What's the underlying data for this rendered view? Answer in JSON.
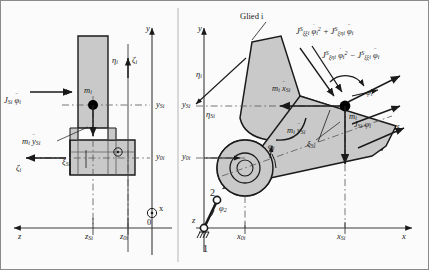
{
  "figure": {
    "title_label": "Glied i"
  },
  "colors": {
    "body_fill": "#c9c9c9",
    "body_stroke": "#1a1a1a",
    "axis": "#3a3a3a",
    "dash": "#555555",
    "background": "#fbfbfb",
    "mass_point": "#000000"
  },
  "left_view": {
    "name": "front-view",
    "axes": [
      {
        "name": "y-axis",
        "label": "y"
      },
      {
        "name": "z-axis",
        "label": "z"
      },
      {
        "name": "x-axis-out-of-page",
        "label": "x"
      },
      {
        "name": "origin",
        "label": "0"
      }
    ],
    "coordinate_labels": [
      {
        "name": "y-si",
        "base": "y",
        "sub": "Si"
      },
      {
        "name": "y-0i",
        "base": "y",
        "sub": "0i"
      },
      {
        "name": "z-si",
        "base": "z",
        "sub": "Si"
      },
      {
        "name": "z-0i",
        "base": "z",
        "sub": "0i"
      }
    ],
    "body_axes": [
      {
        "name": "eta-i",
        "base": "η",
        "sub": "i"
      },
      {
        "name": "xi-i-top",
        "base": "ζ",
        "sub": "i"
      },
      {
        "name": "zeta-i-left",
        "base": "ζ",
        "sub": "i"
      },
      {
        "name": "xi-si",
        "base": "ξ",
        "sub": "Si"
      }
    ],
    "mass_label": {
      "base": "m",
      "sub": "i"
    },
    "forces": [
      {
        "name": "moment-jsi-phi",
        "base": "J",
        "sub": "Si",
        "sym": "φ",
        "sym_sub": "i",
        "dots": 2,
        "text": "J_Si φ̈_i"
      },
      {
        "name": "force-mi-ysi",
        "base": "m",
        "sub": "i",
        "sym": "y",
        "sym_sub": "Si",
        "dots": 2,
        "text": "m_i ÿ_Si"
      }
    ]
  },
  "right_view": {
    "name": "side-view",
    "axes": [
      {
        "name": "y-axis",
        "label": "y"
      },
      {
        "name": "x-axis",
        "label": "x"
      }
    ],
    "coordinate_labels": [
      {
        "name": "y-si",
        "base": "y",
        "sub": "Si"
      },
      {
        "name": "y-0i",
        "base": "y",
        "sub": "0i"
      },
      {
        "name": "x-0i",
        "base": "x",
        "sub": "0i"
      },
      {
        "name": "x-si",
        "base": "x",
        "sub": "Si"
      }
    ],
    "body_axes": [
      {
        "name": "eta-i",
        "base": "η",
        "sub": "i"
      },
      {
        "name": "eta-si",
        "base": "η",
        "sub": "Si"
      },
      {
        "name": "xi-si",
        "base": "ξ",
        "sub": "Si"
      },
      {
        "name": "xi-i",
        "base": "ξ",
        "sub": "i"
      }
    ],
    "mass_label": {
      "base": "m",
      "sub": "i"
    },
    "angles": [
      {
        "name": "phi-i",
        "base": "φ",
        "sub": "i"
      },
      {
        "name": "phi-i-rot",
        "base": "φ",
        "sub": "i"
      },
      {
        "name": "phi-2",
        "base": "φ",
        "sub": "2"
      }
    ],
    "forces": [
      {
        "name": "force-mi-xsi",
        "text": "m_i ẍ_Si"
      },
      {
        "name": "force-mi-ysi",
        "text": "m_i ÿ_Si"
      },
      {
        "name": "moment-jsi-phi",
        "text": "J_Si φ̈_i"
      }
    ],
    "formulas": [
      {
        "name": "formula-upper",
        "text": "J^S_ξξi φ̇_i² + J^S_ξηi φ̈_i"
      },
      {
        "name": "formula-lower",
        "text": "J^S_ξηi φ̇_i² − J^S_ξξi φ̈_i"
      }
    ],
    "linkage": [
      {
        "name": "link-1-label",
        "label": "1"
      },
      {
        "name": "link-2-label",
        "label": "2"
      },
      {
        "name": "ground-joint-z",
        "label": "z"
      }
    ]
  }
}
